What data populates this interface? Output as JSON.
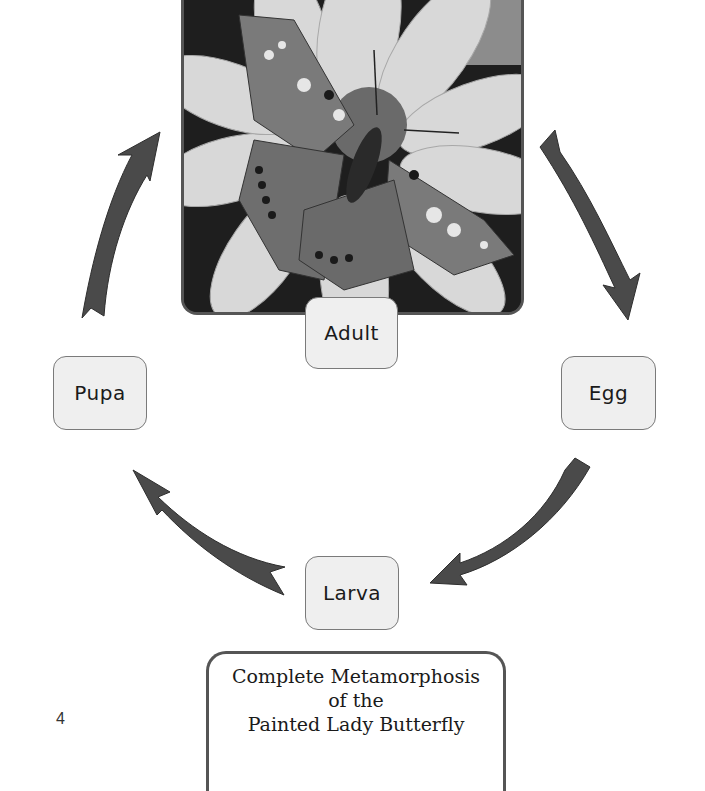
{
  "diagram": {
    "type": "life-cycle",
    "stages": {
      "adult": "Adult",
      "egg": "Egg",
      "larva": "Larva",
      "pupa": "Pupa"
    },
    "cycle_order": [
      "Adult",
      "Egg",
      "Larva",
      "Pupa"
    ],
    "arrow_color": "#4a4a4a",
    "photo": {
      "subject": "painted-lady-butterfly-on-flower",
      "style": "grayscale"
    },
    "title": {
      "line1": "Complete Metamorphosis",
      "line2": "of the",
      "line3": "Painted Lady Butterfly"
    }
  },
  "page": {
    "number": "4"
  }
}
